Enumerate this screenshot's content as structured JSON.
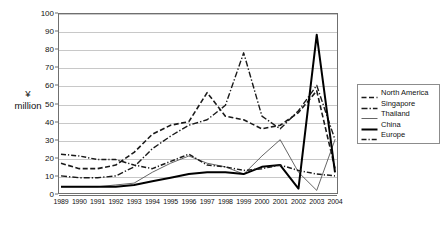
{
  "axes": {
    "ylabel_line1": "¥",
    "ylabel_line2": "million",
    "yticks": [
      "0",
      "10",
      "20",
      "30",
      "40",
      "50",
      "60",
      "70",
      "80",
      "90",
      "100"
    ],
    "xticks": [
      "1989",
      "1990",
      "1991",
      "1992",
      "1993",
      "1994",
      "1995",
      "1996",
      "1997",
      "1998",
      "1999",
      "2000",
      "2001",
      "2002",
      "2003",
      "2004"
    ]
  },
  "legend": {
    "items": [
      {
        "label": "North America",
        "style": "dashed",
        "color": "#1a1a1a"
      },
      {
        "label": "Singapore",
        "style": "dashdot",
        "color": "#1a1a1a"
      },
      {
        "label": "Thailand",
        "style": "thin",
        "color": "#555555"
      },
      {
        "label": "China",
        "style": "thick",
        "color": "#000000"
      },
      {
        "label": "Europe",
        "style": "dashdot2",
        "color": "#1a1a1a"
      }
    ]
  },
  "chart_data": {
    "type": "line",
    "title": "",
    "xlabel": "",
    "ylabel": "¥ million",
    "ylim": [
      0,
      100
    ],
    "ytick_step": 10,
    "grid": true,
    "legend_position": "right",
    "categories": [
      "1989",
      "1990",
      "1991",
      "1992",
      "1993",
      "1994",
      "1995",
      "1996",
      "1997",
      "1998",
      "1999",
      "2000",
      "2001",
      "2002",
      "2003",
      "2004"
    ],
    "series": [
      {
        "name": "North America",
        "style": "dashed",
        "values": [
          17,
          14,
          14,
          16,
          23,
          33,
          38,
          40,
          56,
          43,
          41,
          36,
          38,
          45,
          57,
          14
        ]
      },
      {
        "name": "Singapore",
        "style": "dashdot",
        "values": [
          10,
          9,
          9,
          10,
          15,
          25,
          32,
          38,
          41,
          49,
          78,
          43,
          36,
          46,
          60,
          30
        ]
      },
      {
        "name": "Thailand",
        "style": "thin",
        "values": [
          4,
          4,
          4,
          5,
          6,
          12,
          17,
          21,
          17,
          15,
          11,
          21,
          30,
          12,
          2,
          30
        ]
      },
      {
        "name": "China",
        "style": "thick",
        "values": [
          4,
          4,
          4,
          4,
          5,
          7,
          9,
          11,
          12,
          12,
          11,
          15,
          16,
          3,
          88,
          12
        ]
      },
      {
        "name": "Europe",
        "style": "dashdot2",
        "values": [
          22,
          21,
          19,
          19,
          16,
          14,
          18,
          22,
          16,
          15,
          13,
          14,
          16,
          13,
          11,
          10
        ]
      }
    ]
  }
}
